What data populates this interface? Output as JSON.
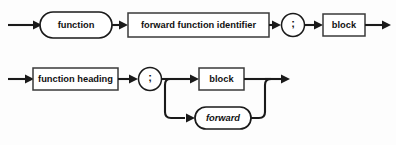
{
  "diagram": {
    "type": "railroad-syntax-diagram",
    "background_color": "#fdfdfd",
    "line_color": "#1a1a1a",
    "box_fill": "#ffffff",
    "rows": [
      {
        "id": "forward-declaration",
        "name": "forward function declaration",
        "baseline_y": 25,
        "entry_arrow": {
          "from_x": 8,
          "to_x": 38
        },
        "exit_arrow": {
          "from_x": 365,
          "to_x": 390
        },
        "nodes": [
          {
            "id": "kw-function",
            "label": "function",
            "shape": "stadium",
            "kind": "terminal",
            "x": 40,
            "y": 12,
            "w": 72,
            "h": 26
          },
          {
            "id": "nt-forward-function-identifier",
            "label": "forward function identifier",
            "shape": "rect",
            "kind": "nonterminal",
            "x": 128,
            "y": 13,
            "w": 141,
            "h": 24
          },
          {
            "id": "sym-semicolon-1",
            "label": ";",
            "shape": "circle",
            "kind": "terminal",
            "cx": 293,
            "cy": 25,
            "r": 12
          },
          {
            "id": "nt-block-1",
            "label": "block",
            "shape": "rect",
            "kind": "nonterminal",
            "x": 323,
            "y": 14,
            "w": 42,
            "h": 22
          }
        ]
      },
      {
        "id": "function-definition",
        "name": "function definition with optional forward",
        "baseline_y": 79,
        "branch_y": 118,
        "entry_arrow": {
          "from_x": 8,
          "to_x": 31
        },
        "exit_arrow": {
          "from_x": 265,
          "to_x": 290
        },
        "split_x": 175,
        "join_x": 265,
        "nodes": [
          {
            "id": "nt-function-heading",
            "label": "function heading",
            "shape": "rect",
            "kind": "nonterminal",
            "x": 33,
            "y": 68,
            "w": 85,
            "h": 22
          },
          {
            "id": "sym-semicolon-2",
            "label": ";",
            "shape": "circle",
            "kind": "terminal",
            "cx": 150,
            "cy": 79,
            "r": 12
          },
          {
            "id": "nt-block-2",
            "label": "block",
            "shape": "rect",
            "kind": "nonterminal",
            "x": 199,
            "y": 68,
            "w": 45,
            "h": 22
          },
          {
            "id": "kw-forward",
            "label": "forward",
            "shape": "stadium",
            "kind": "terminal-italic",
            "x": 195,
            "y": 107,
            "w": 56,
            "h": 22
          }
        ]
      }
    ]
  }
}
